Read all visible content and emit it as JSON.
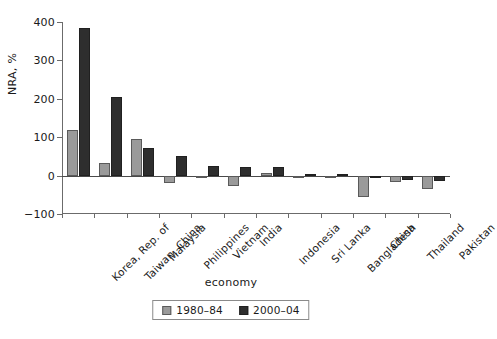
{
  "chart_data": {
    "type": "bar",
    "title": "",
    "subtitle": "",
    "xlabel": "economy",
    "ylabel": "NRA, %",
    "ylim": [
      -100,
      400
    ],
    "yticks": [
      -100,
      0,
      100,
      200,
      300,
      400
    ],
    "ytick_labels": [
      "−100",
      "0",
      "100",
      "200",
      "300",
      "400"
    ],
    "grid": false,
    "legend_position": "bottom-center",
    "categories": [
      "Korea, Rep. of",
      "Taiwan, China",
      "Malaysia",
      "Philippines",
      "Vietnam",
      "India",
      "Indonesia",
      "Sri Lanka",
      "Bangladesh",
      "China",
      "Thailand",
      "Pakistan"
    ],
    "series": [
      {
        "name": "1980–84",
        "color": "#9a9a9a",
        "values": [
          120,
          32,
          96,
          -18,
          -4,
          -28,
          8,
          -5,
          -4,
          -55,
          -17,
          -35
        ]
      },
      {
        "name": "2000–04",
        "color": "#2e2e2e",
        "values": [
          385,
          205,
          72,
          52,
          24,
          22,
          22,
          5,
          3,
          -5,
          -11,
          -13
        ]
      }
    ]
  },
  "legend": {
    "entries": [
      {
        "label": "1980–84",
        "swatch": "gray-square-icon"
      },
      {
        "label": "2000–04",
        "swatch": "dark-square-icon"
      }
    ]
  },
  "axes": {
    "y_title": "NRA, %",
    "x_title": "economy"
  },
  "colors": {
    "series_1980_84": "#9a9a9a",
    "series_2000_04": "#2e2e2e",
    "axis": "#6b6b6b",
    "background": "#ffffff",
    "text": "#1a1a1a"
  }
}
